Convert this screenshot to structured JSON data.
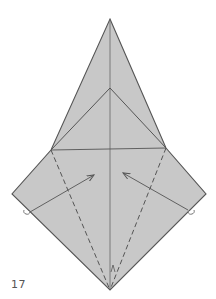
{
  "step": {
    "number": "17"
  },
  "colors": {
    "paper_fill": "#c8c8c8",
    "line": "#555555",
    "background": "#ffffff"
  },
  "diagram": {
    "outline_points": [
      [
        110,
        19
      ],
      [
        166,
        148
      ],
      [
        206,
        194
      ],
      [
        110,
        290
      ],
      [
        12,
        194
      ],
      [
        51,
        150
      ]
    ],
    "center_line": [
      [
        110,
        19
      ],
      [
        110,
        290
      ]
    ],
    "inner_triangle": [
      [
        51,
        150
      ],
      [
        110,
        88
      ],
      [
        166,
        148
      ]
    ],
    "horizontal_crease": [
      [
        51,
        150
      ],
      [
        166,
        148
      ]
    ],
    "valley_folds": [
      [
        [
          51,
          150
        ],
        [
          110,
          290
        ]
      ],
      [
        [
          166,
          148
        ],
        [
          110,
          290
        ]
      ]
    ],
    "arrows": [
      {
        "from": [
          30,
          212
        ],
        "to": [
          94,
          175
        ]
      },
      {
        "from": [
          188,
          210
        ],
        "to": [
          123,
          173
        ]
      }
    ],
    "corner_marks": [
      [
        27,
        212
      ],
      [
        191,
        212
      ]
    ],
    "bottom_mark": [
      113,
      268
    ]
  }
}
